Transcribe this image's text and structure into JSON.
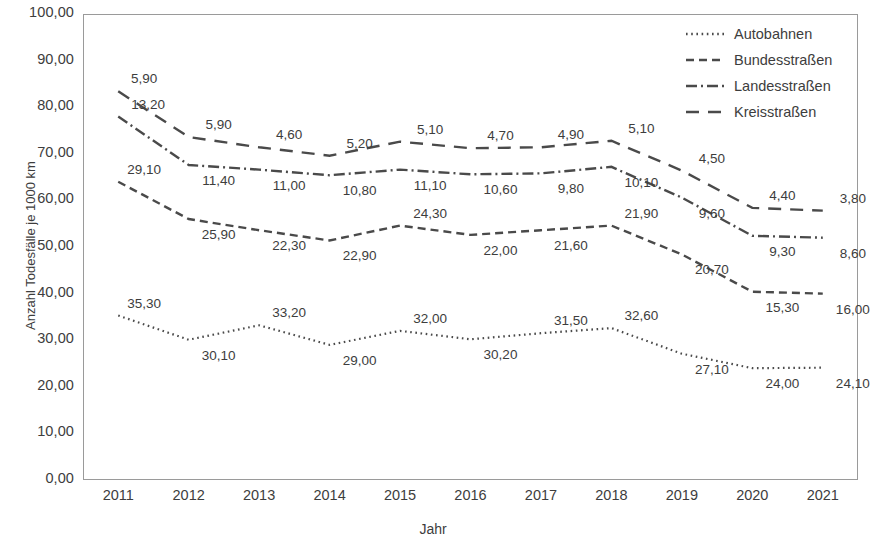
{
  "chart_data": {
    "type": "line",
    "title": "",
    "xlabel": "Jahr",
    "ylabel": "Anzahl Todesfälle je 1000 km",
    "categories": [
      "2011",
      "2012",
      "2013",
      "2014",
      "2015",
      "2016",
      "2017",
      "2018",
      "2019",
      "2020",
      "2021"
    ],
    "ylim": [
      0,
      100
    ],
    "yticks": [
      "0,00",
      "10,00",
      "20,00",
      "30,00",
      "40,00",
      "50,00",
      "60,00",
      "70,00",
      "80,00",
      "90,00",
      "100,00"
    ],
    "grid": false,
    "legend_position": "top-right",
    "series": [
      {
        "name": "Autobahnen",
        "style": "dotted",
        "values": [
          35.3,
          30.1,
          33.2,
          29.0,
          32.0,
          30.2,
          31.5,
          32.6,
          27.1,
          24.0,
          24.1
        ],
        "labels": [
          "35,30",
          "30,10",
          "33,20",
          "29,00",
          "32,00",
          "30,20",
          "31,50",
          "32,60",
          "27,10",
          "24,00",
          "24,10"
        ],
        "plot_y": [
          35.3,
          30.1,
          33.2,
          29.0,
          32.0,
          30.2,
          31.5,
          32.6,
          27.1,
          24.0,
          24.1
        ]
      },
      {
        "name": "Bundesstraßen",
        "style": "dashed",
        "values": [
          29.1,
          25.9,
          22.3,
          22.9,
          24.3,
          22.0,
          21.6,
          21.9,
          20.7,
          15.3,
          16.0
        ],
        "labels": [
          "29,10",
          "25,90",
          "22,30",
          "22,90",
          "24,30",
          "22,00",
          "21,60",
          "21,90",
          "20,70",
          "15,30",
          "16,00"
        ],
        "plot_y": [
          64.0,
          56.0,
          53.6,
          51.4,
          54.6,
          52.6,
          53.6,
          54.6,
          48.4,
          40.4,
          40.0
        ]
      },
      {
        "name": "Landesstraßen",
        "style": "dashdot",
        "values": [
          13.2,
          11.4,
          11.0,
          10.8,
          11.1,
          10.6,
          9.8,
          10.1,
          9.6,
          9.3,
          8.6
        ],
        "labels": [
          "13,20",
          "11,40",
          "11,00",
          "10,80",
          "11,10",
          "10,60",
          "9,80",
          "10,10",
          "9,60",
          "9,30",
          "8,60"
        ],
        "plot_y": [
          78.0,
          67.6,
          66.6,
          65.4,
          66.6,
          65.6,
          65.8,
          67.2,
          60.6,
          52.4,
          52.0
        ]
      },
      {
        "name": "Kreisstraßen",
        "style": "longdash",
        "values": [
          5.9,
          5.9,
          4.6,
          5.2,
          5.1,
          4.7,
          4.9,
          5.1,
          4.5,
          4.4,
          3.8
        ],
        "labels": [
          "5,90",
          "5,90",
          "4,60",
          "5,20",
          "5,10",
          "4,70",
          "4,90",
          "5,10",
          "4,50",
          "4,40",
          "3,80"
        ],
        "plot_y": [
          83.4,
          73.6,
          71.4,
          69.6,
          72.6,
          71.2,
          71.4,
          72.8,
          66.4,
          58.4,
          57.8
        ]
      }
    ]
  },
  "legend": {
    "items": [
      {
        "label": "Autobahnen"
      },
      {
        "label": "Bundesstraßen"
      },
      {
        "label": "Landesstraßen"
      },
      {
        "label": "Kreisstraßen"
      }
    ]
  },
  "colors": {
    "line": "#4a4a4a",
    "axis": "#9a9a9a",
    "text": "#3d3d3d"
  }
}
